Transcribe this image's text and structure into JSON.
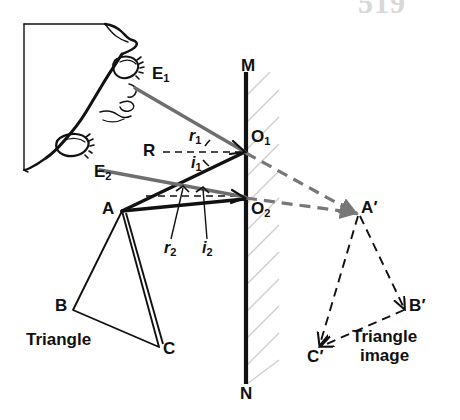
{
  "figure": {
    "page_number": "519",
    "title_caption_left": "Triangle",
    "title_caption_right_line1": "Triangle",
    "title_caption_right_line2": "image",
    "colors": {
      "ink": "#111111",
      "eye_ray": "#6e6e6e",
      "virtual_ray": "#777777",
      "hatch": "#cccccc",
      "page_number": "#d8d8d8",
      "background": "#ffffff"
    },
    "labels": {
      "mirror_top": "M",
      "mirror_bottom": "N",
      "eye_ray_1": {
        "base": "E",
        "sub": "1"
      },
      "eye_ray_2": {
        "base": "E",
        "sub": "2"
      },
      "incidence_point_1": {
        "base": "O",
        "sub": "1"
      },
      "incidence_point_2": {
        "base": "O",
        "sub": "2"
      },
      "normal": "R",
      "angle_reflection_1": {
        "base": "r",
        "sub": "1"
      },
      "angle_incidence_1": {
        "base": "i",
        "sub": "1"
      },
      "angle_reflection_2": {
        "base": "r",
        "sub": "2"
      },
      "angle_incidence_2": {
        "base": "i",
        "sub": "2"
      },
      "object_a": "A",
      "object_b": "B",
      "object_c": "C",
      "image_a": "A′",
      "image_b": "B′",
      "image_c": "C′"
    },
    "geometry": {
      "mirror": {
        "x": 246,
        "y_top": 72,
        "y_bottom": 384
      },
      "point_o1": {
        "x": 246,
        "y": 152
      },
      "point_o2": {
        "x": 246,
        "y": 203
      },
      "point_a": {
        "x": 122,
        "y": 211
      },
      "point_b": {
        "x": 73,
        "y": 310
      },
      "point_c": {
        "x": 159,
        "y": 347
      },
      "point_a_prime": {
        "x": 360,
        "y": 212
      },
      "point_b_prime": {
        "x": 404,
        "y": 310
      },
      "point_c_prime": {
        "x": 320,
        "y": 348
      },
      "eye_1": {
        "x": 138,
        "y": 90
      },
      "eye_2": {
        "x": 108,
        "y": 171
      },
      "normal_start": {
        "x": 163,
        "y": 152
      }
    }
  }
}
